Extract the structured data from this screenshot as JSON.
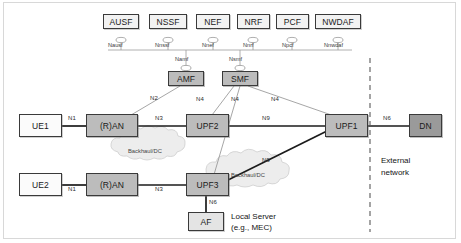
{
  "diagram": {
    "colors": {
      "nf_fill": "#f2f2f2",
      "gray_fill": "#bcbcbc",
      "dark_fill": "#9a9a9a",
      "af_fill": "#e4e4e4",
      "stroke": "#3a3a3a",
      "thin_stroke": "#9d9d9d",
      "cloud_fill": "#ededed"
    },
    "network_functions": [
      {
        "name": "AUSF",
        "sbi": "Nausf"
      },
      {
        "name": "NSSF",
        "sbi": "Nnssf"
      },
      {
        "name": "NEF",
        "sbi": "Nnef"
      },
      {
        "name": "NRF",
        "sbi": "Nnrf"
      },
      {
        "name": "PCF",
        "sbi": "Npcf"
      },
      {
        "name": "NWDAF",
        "sbi": "Nnwdaf"
      }
    ],
    "control_plane": [
      {
        "name": "AMF",
        "sbi": "Namf"
      },
      {
        "name": "SMF",
        "sbi": "Nsmf"
      }
    ],
    "user_equipment": [
      {
        "name": "UE1"
      },
      {
        "name": "UE2"
      }
    ],
    "access_nodes": [
      {
        "name": "(R)AN"
      },
      {
        "name": "(R)AN"
      }
    ],
    "user_plane_functions": [
      {
        "name": "UPF2"
      },
      {
        "name": "UPF3"
      },
      {
        "name": "UPF1"
      }
    ],
    "data_network": {
      "name": "DN"
    },
    "application_function": {
      "name": "AF"
    },
    "clouds": [
      {
        "label": "Backhaul/DC"
      },
      {
        "label": "Backhaul/DC"
      }
    ],
    "reference_points": {
      "ue1_ran": "N1",
      "ue2_ran": "N1",
      "amf_ran": "N2",
      "ran1_upf2": "N3",
      "ran2_upf3": "N3",
      "smf_upf2": "N4",
      "smf_upf3": "N4",
      "smf_upf1": "N4",
      "upf2_upf1": "N9",
      "upf3_upf1": "N9",
      "upf1_dn": "N6",
      "upf3_af": "N6"
    },
    "annotations": {
      "external_network_line1": "External",
      "external_network_line2": "network",
      "local_server_line1": "Local Server",
      "local_server_line2": "(e.g., MEC)"
    }
  }
}
